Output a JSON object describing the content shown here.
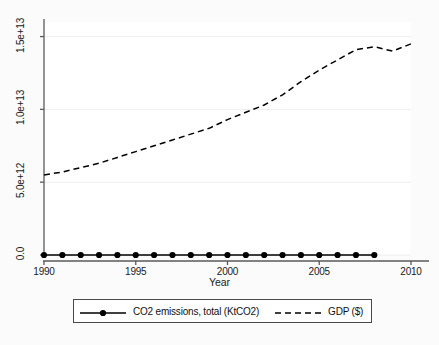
{
  "chart_data": {
    "type": "line",
    "title": "",
    "xlabel": "Year",
    "ylabel": "",
    "xlim": [
      1990,
      2010
    ],
    "ylim": [
      0,
      16000000000000
    ],
    "grid": true,
    "grid_axis": "y",
    "legend": {
      "position": "bottom",
      "entries": [
        {
          "name": "CO2 emissions, total (KtCO2)",
          "marker": "filled-circle",
          "line_style": "solid"
        },
        {
          "name": "GDP ($)",
          "marker": "none",
          "line_style": "dashed"
        }
      ]
    },
    "xticks": [
      1990,
      1995,
      2000,
      2005,
      2010
    ],
    "xtick_labels": [
      "1990",
      "1995",
      "2000",
      "2005",
      "2010"
    ],
    "yticks": [
      0,
      5000000000000,
      10000000000000,
      15000000000000
    ],
    "ytick_labels": [
      "0.0",
      "5.0e+12",
      "1.0e+13",
      "1.5e+13"
    ],
    "x": [
      1990,
      1991,
      1992,
      1993,
      1994,
      1995,
      1996,
      1997,
      1998,
      1999,
      2000,
      2001,
      2002,
      2003,
      2004,
      2005,
      2006,
      2007,
      2008,
      2009,
      2010
    ],
    "series": [
      {
        "name": "CO2 emissions, total (KtCO2)",
        "color": "#000000",
        "line_style": "solid",
        "marker": "filled-circle",
        "x": [
          1990,
          1991,
          1992,
          1993,
          1994,
          1995,
          1996,
          1997,
          1998,
          1999,
          2000,
          2001,
          2002,
          2003,
          2004,
          2005,
          2006,
          2007,
          2008
        ],
        "values": [
          22600000,
          22700000,
          22600000,
          22700000,
          22900000,
          23200000,
          23700000,
          23900000,
          24000000,
          24100000,
          24700000,
          25000000,
          25400000,
          26400000,
          27600000,
          28600000,
          29400000,
          30200000,
          30600000
        ]
      },
      {
        "name": "GDP ($)",
        "color": "#000000",
        "line_style": "dashed",
        "marker": "none",
        "x": [
          1990,
          1991,
          1992,
          1993,
          1994,
          1995,
          1996,
          1997,
          1998,
          1999,
          2000,
          2001,
          2002,
          2003,
          2004,
          2005,
          2006,
          2007,
          2008,
          2009,
          2010
        ],
        "values": [
          5500000000000,
          5700000000000,
          6000000000000,
          6300000000000,
          6700000000000,
          7100000000000,
          7500000000000,
          7900000000000,
          8300000000000,
          8700000000000,
          9300000000000,
          9800000000000,
          10300000000000,
          11000000000000,
          11900000000000,
          12700000000000,
          13400000000000,
          14100000000000,
          14300000000000,
          14000000000000,
          14500000000000
        ]
      }
    ]
  },
  "axes": {
    "xaxis_title": "Year",
    "ytick_labels": [
      "1.5e+13",
      "1.0e+13",
      "5.0e+12",
      "0.0"
    ],
    "xtick_labels": [
      "1990",
      "1995",
      "2000",
      "2005",
      "2010"
    ]
  },
  "legend": {
    "co2_label": "CO2 emissions, total (KtCO2)",
    "gdp_label": "GDP ($)"
  },
  "colors": {
    "line": "#000000",
    "grid": "#eeeeee",
    "axis": "#5a5a5a",
    "plot_background": "#ffffff",
    "figure_background": "#fbfbfb"
  }
}
